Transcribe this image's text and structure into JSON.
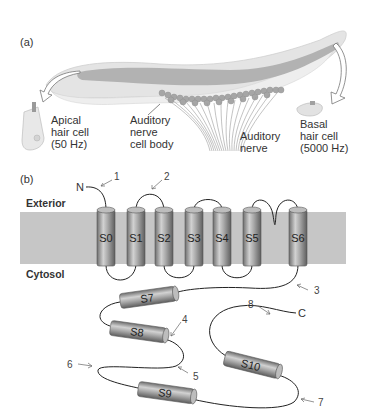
{
  "panel_a": {
    "label": "(a)",
    "apical": {
      "line1": "Apical",
      "line2": "hair cell",
      "line3": "(50 Hz)"
    },
    "cell_body": {
      "line1": "Auditory",
      "line2": "nerve",
      "line3": "cell body"
    },
    "nerve": {
      "line1": "Auditory",
      "line2": "nerve"
    },
    "basal": {
      "line1": "Basal",
      "line2": "hair cell",
      "line3": "(5000 Hz)"
    }
  },
  "panel_b": {
    "label": "(b)",
    "exterior": "Exterior",
    "cytosol": "Cytosol",
    "n_terminus": "N",
    "c_terminus": "C",
    "segments": [
      "S0",
      "S1",
      "S2",
      "S3",
      "S4",
      "S5",
      "S6",
      "S7",
      "S8",
      "S9",
      "S10"
    ],
    "callouts": [
      "1",
      "2",
      "3",
      "4",
      "5",
      "6",
      "7",
      "8"
    ]
  },
  "colors": {
    "membrane": "#c8c8c8",
    "cochlea_light": "#e6e6e6",
    "cochlea_band": "#b4b4b4",
    "cylinder": "#9a9a9a",
    "text": "#333333"
  }
}
